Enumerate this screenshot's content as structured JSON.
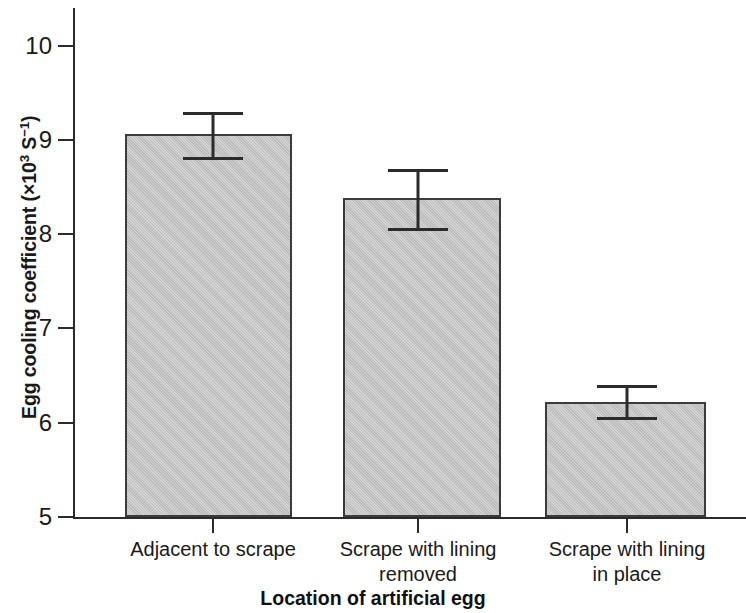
{
  "chart_data": {
    "type": "bar",
    "title": "",
    "xlabel": "Location of artificial egg",
    "ylabel": "Egg cooling coefficient (×10³ S⁻¹)",
    "ylabel_prefix": "Egg cooling coefficient (×10",
    "ylabel_exp1": "3",
    "ylabel_mid": " S",
    "ylabel_exp2": "−1",
    "ylabel_suffix": ")",
    "categories": [
      "Adjacent to scrape",
      "Scrape with lining removed",
      "Scrape with lining in place"
    ],
    "category_lines": [
      [
        "Adjacent to scrape"
      ],
      [
        "Scrape with lining",
        "removed"
      ],
      [
        "Scrape with lining",
        "in place"
      ]
    ],
    "values": [
      9.06,
      8.38,
      6.22
    ],
    "error_upper": [
      9.29,
      8.68,
      6.39
    ],
    "error_lower": [
      8.81,
      8.06,
      6.05
    ],
    "errors": [
      0.235,
      0.31,
      0.17
    ],
    "ylim": [
      5,
      10.4
    ],
    "yticks": [
      10,
      9,
      8,
      7,
      6,
      5
    ],
    "ytick_labels": [
      "10",
      "9",
      "8",
      "7",
      "6",
      "5"
    ],
    "grid": false,
    "legend": "none",
    "bar_fill_color": "#c2c2c2",
    "bar_edge_color": "#3b3b3b",
    "axis_color": "#2b2b2b",
    "background_color": "#ffffff"
  }
}
